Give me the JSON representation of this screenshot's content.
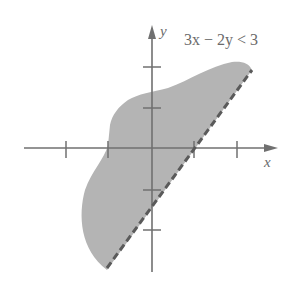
{
  "figure": {
    "inequality": "3x − 2y < 3",
    "axis_labels": {
      "x": "x",
      "y": "y"
    },
    "boundary": {
      "equation": "3x − 2y = 3",
      "style": "dashed"
    },
    "shaded_region": "solution set (above/left of boundary line)",
    "colors": {
      "shade": "#b4b4b4",
      "axes": "#707070",
      "boundary": "#5a5a5a",
      "text": "#6a6a6a"
    },
    "ticks": {
      "x": [
        -2,
        -1,
        1,
        2
      ],
      "y": [
        2,
        1,
        -1,
        -2
      ]
    }
  }
}
